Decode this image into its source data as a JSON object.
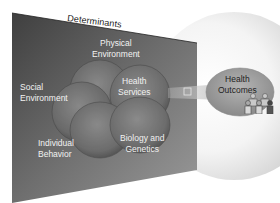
{
  "diagram": {
    "title": "Determinants",
    "determinants": [
      {
        "id": "physical",
        "line1": "Physical",
        "line2": "Environment"
      },
      {
        "id": "social",
        "line1": "Social",
        "line2": "Environment"
      },
      {
        "id": "health-services",
        "line1": "Health",
        "line2": "Services"
      },
      {
        "id": "individual",
        "line1": "Individual",
        "line2": "Behavior"
      },
      {
        "id": "biology",
        "line1": "Biology and",
        "line2": "Genetics"
      }
    ],
    "outcome": {
      "line1": "Health",
      "line2": "Outcomes"
    },
    "arrow_label": "",
    "colors": {
      "panel_dark": "#4a4a4a",
      "panel_light": "#a9a9a9",
      "circle_fill": "#7a7a7a",
      "outcome_fill": "#9c9c9c",
      "halo": "#d6d6d6"
    }
  }
}
